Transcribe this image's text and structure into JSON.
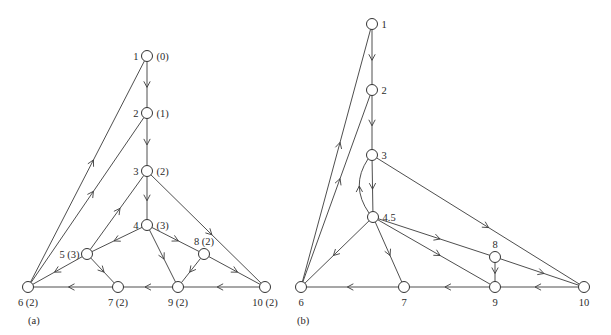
{
  "figure": {
    "panels": [
      {
        "id": "a",
        "caption": "(a)",
        "caption_pos": [
          28,
          324
        ],
        "nodes": [
          {
            "id": "1",
            "label": "1",
            "level": "(0)",
            "x": 147,
            "y": 56,
            "label_pos": "left-right"
          },
          {
            "id": "2",
            "label": "2",
            "level": "(1)",
            "x": 147,
            "y": 113,
            "label_pos": "left-right"
          },
          {
            "id": "3",
            "label": "3",
            "level": "(2)",
            "x": 147,
            "y": 171,
            "label_pos": "left-right"
          },
          {
            "id": "4",
            "label": "4",
            "level": "(3)",
            "x": 147,
            "y": 225,
            "label_pos": "left-right"
          },
          {
            "id": "5",
            "label": "5 (3)",
            "level": "",
            "x": 87,
            "y": 254,
            "label_pos": "left"
          },
          {
            "id": "8",
            "label": "8 (2)",
            "level": "",
            "x": 204,
            "y": 254,
            "label_pos": "above"
          },
          {
            "id": "6",
            "label": "6 (2)",
            "level": "",
            "x": 28,
            "y": 287,
            "label_pos": "below"
          },
          {
            "id": "7",
            "label": "7 (2)",
            "level": "",
            "x": 118,
            "y": 287,
            "label_pos": "below"
          },
          {
            "id": "9",
            "label": "9 (2)",
            "level": "",
            "x": 178,
            "y": 287,
            "label_pos": "below"
          },
          {
            "id": "10",
            "label": "10 (2)",
            "level": "",
            "x": 265,
            "y": 287,
            "label_pos": "below"
          }
        ],
        "edges": [
          {
            "from": "1",
            "to": "2"
          },
          {
            "from": "2",
            "to": "3"
          },
          {
            "from": "3",
            "to": "4"
          },
          {
            "from": "3",
            "to": "10"
          },
          {
            "from": "5",
            "to": "3"
          },
          {
            "from": "4",
            "to": "5"
          },
          {
            "from": "4",
            "to": "8"
          },
          {
            "from": "4",
            "to": "9"
          },
          {
            "from": "5",
            "to": "6"
          },
          {
            "from": "5",
            "to": "7"
          },
          {
            "from": "8",
            "to": "9"
          },
          {
            "from": "8",
            "to": "10"
          },
          {
            "from": "10",
            "to": "9"
          },
          {
            "from": "9",
            "to": "7"
          },
          {
            "from": "7",
            "to": "6"
          },
          {
            "from": "6",
            "to": "1"
          },
          {
            "from": "6",
            "to": "2"
          }
        ]
      },
      {
        "id": "b",
        "caption": "(b)",
        "caption_pos": [
          297,
          324
        ],
        "nodes": [
          {
            "id": "1",
            "label": "1",
            "x": 372,
            "y": 24,
            "label_pos": "right"
          },
          {
            "id": "2",
            "label": "2",
            "x": 372,
            "y": 90,
            "label_pos": "right"
          },
          {
            "id": "3",
            "label": "3",
            "x": 372,
            "y": 155,
            "label_pos": "right"
          },
          {
            "id": "4.5",
            "label": "4.5",
            "x": 373,
            "y": 217,
            "label_pos": "right"
          },
          {
            "id": "8",
            "label": "8",
            "x": 495,
            "y": 257,
            "label_pos": "above"
          },
          {
            "id": "6",
            "label": "6",
            "x": 301,
            "y": 287,
            "label_pos": "below"
          },
          {
            "id": "7",
            "label": "7",
            "x": 404,
            "y": 287,
            "label_pos": "below"
          },
          {
            "id": "9",
            "label": "9",
            "x": 495,
            "y": 287,
            "label_pos": "below"
          },
          {
            "id": "10",
            "label": "10",
            "x": 584,
            "y": 287,
            "label_pos": "below"
          }
        ],
        "edges": [
          {
            "from": "1",
            "to": "2"
          },
          {
            "from": "2",
            "to": "3"
          },
          {
            "from": "3",
            "to": "4.5"
          },
          {
            "from": "4.5",
            "to": "3",
            "curved": true
          },
          {
            "from": "3",
            "to": "10"
          },
          {
            "from": "4.5",
            "to": "6"
          },
          {
            "from": "4.5",
            "to": "7"
          },
          {
            "from": "4.5",
            "to": "8"
          },
          {
            "from": "4.5",
            "to": "9"
          },
          {
            "from": "8",
            "to": "9"
          },
          {
            "from": "8",
            "to": "10"
          },
          {
            "from": "10",
            "to": "9"
          },
          {
            "from": "9",
            "to": "7"
          },
          {
            "from": "7",
            "to": "6"
          },
          {
            "from": "6",
            "to": "1"
          },
          {
            "from": "6",
            "to": "2"
          }
        ]
      }
    ]
  }
}
